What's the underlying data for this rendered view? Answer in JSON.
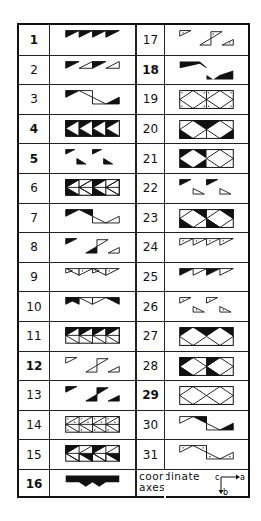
{
  "table": {
    "title": "Symmetry pattern table",
    "left_column": [
      {
        "n": "1",
        "bold": true,
        "pattern": "pattern-1"
      },
      {
        "n": "2",
        "bold": false,
        "pattern": "pattern-2"
      },
      {
        "n": "3",
        "bold": false,
        "pattern": "pattern-3"
      },
      {
        "n": "4",
        "bold": true,
        "pattern": "pattern-4"
      },
      {
        "n": "5",
        "bold": true,
        "pattern": "pattern-5"
      },
      {
        "n": "6",
        "bold": false,
        "pattern": "pattern-6"
      },
      {
        "n": "7",
        "bold": false,
        "pattern": "pattern-7"
      },
      {
        "n": "8",
        "bold": false,
        "pattern": "pattern-8"
      },
      {
        "n": "9",
        "bold": false,
        "pattern": "pattern-9"
      },
      {
        "n": "10",
        "bold": false,
        "pattern": "pattern-10"
      },
      {
        "n": "11",
        "bold": false,
        "pattern": "pattern-11"
      },
      {
        "n": "12",
        "bold": true,
        "pattern": "pattern-12"
      },
      {
        "n": "13",
        "bold": false,
        "pattern": "pattern-13"
      },
      {
        "n": "14",
        "bold": false,
        "pattern": "pattern-14"
      },
      {
        "n": "15",
        "bold": false,
        "pattern": "pattern-15"
      },
      {
        "n": "16",
        "bold": true,
        "pattern": "pattern-16"
      }
    ],
    "right_column": [
      {
        "n": "17",
        "bold": false,
        "pattern": "pattern-17"
      },
      {
        "n": "18",
        "bold": true,
        "pattern": "pattern-18"
      },
      {
        "n": "19",
        "bold": false,
        "pattern": "pattern-19"
      },
      {
        "n": "20",
        "bold": false,
        "pattern": "pattern-20"
      },
      {
        "n": "21",
        "bold": false,
        "pattern": "pattern-21"
      },
      {
        "n": "22",
        "bold": false,
        "pattern": "pattern-22"
      },
      {
        "n": "23",
        "bold": false,
        "pattern": "pattern-23"
      },
      {
        "n": "24",
        "bold": false,
        "pattern": "pattern-24"
      },
      {
        "n": "25",
        "bold": false,
        "pattern": "pattern-25"
      },
      {
        "n": "26",
        "bold": false,
        "pattern": "pattern-26"
      },
      {
        "n": "27",
        "bold": false,
        "pattern": "pattern-27"
      },
      {
        "n": "28",
        "bold": false,
        "pattern": "pattern-28"
      },
      {
        "n": "29",
        "bold": true,
        "pattern": "pattern-29"
      },
      {
        "n": "30",
        "bold": false,
        "pattern": "pattern-30"
      },
      {
        "n": "31",
        "bold": false,
        "pattern": "pattern-31"
      }
    ],
    "footer": {
      "label_line1": "coordinate",
      "label_line2": "axes",
      "axis_c": "c",
      "axis_a": "a",
      "axis_b": "b"
    }
  },
  "colors": {
    "ink": "#111111",
    "paper": "#ffffff"
  }
}
